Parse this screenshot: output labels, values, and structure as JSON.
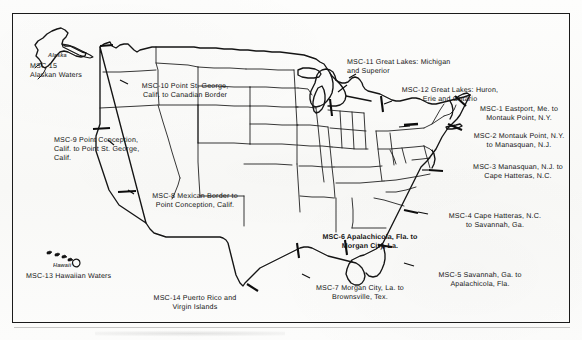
{
  "figure": {
    "type": "map",
    "frame": {
      "border_color": "#1b1b1b"
    },
    "background_color": "#fbfbfa",
    "line_color": "#141414"
  },
  "insets": [
    {
      "name": "alaska",
      "label": "Alaska"
    },
    {
      "name": "hawaii",
      "label": "Hawaii"
    }
  ],
  "zones": [
    {
      "id": "MSC-1",
      "name": "msc-1-eastport-montauk",
      "text": "MSC-1 Eastport, Me. to\nMontauk Point, N.Y.",
      "bold": false,
      "align": "center"
    },
    {
      "id": "MSC-2",
      "name": "msc-2-montauk-manasquan",
      "text": "MSC-2 Montauk Point, N.Y.\nto Manasquan, N.J.",
      "bold": false,
      "align": "center"
    },
    {
      "id": "MSC-3",
      "name": "msc-3-manasquan-hatteras",
      "text": "MSC-3 Manasquan, N.J. to\nCape Hatteras, N.C.",
      "bold": false,
      "align": "center"
    },
    {
      "id": "MSC-4",
      "name": "msc-4-hatteras-savannah",
      "text": "MSC-4 Cape Hatteras, N.C.\nto Savannah, Ga.",
      "bold": false,
      "align": "center"
    },
    {
      "id": "MSC-5",
      "name": "msc-5-savannah-apalachicola",
      "text": "MSC-5 Savannah, Ga. to\nApalachicola, Fla.",
      "bold": false,
      "align": "center"
    },
    {
      "id": "MSC-6",
      "name": "msc-6-apalachicola-morgan-city",
      "text": "MSC-6 Apalachicola, Fla. to\nMorgan City, La.",
      "bold": true,
      "align": "center"
    },
    {
      "id": "MSC-7",
      "name": "msc-7-morgan-city-brownsville",
      "text": "MSC-7 Morgan City, La. to\nBrownsville, Tex.",
      "bold": false,
      "align": "center"
    },
    {
      "id": "MSC-8",
      "name": "msc-8-mexican-border-point-conception",
      "text": "MSC-8 Mexican Border to\nPoint Conception, Calif.",
      "bold": false,
      "align": "center"
    },
    {
      "id": "MSC-9",
      "name": "msc-9-point-conception-point-st-george",
      "text": "MSC-9 Point Conception,\nCalif. to Point St. George,\nCalif.",
      "bold": false,
      "align": "left"
    },
    {
      "id": "MSC-10",
      "name": "msc-10-point-st-george-canadian-border",
      "text": "MSC-10 Point St. George,\nCalif. to Canadian Border",
      "bold": false,
      "align": "center"
    },
    {
      "id": "MSC-11",
      "name": "msc-11-great-lakes-michigan-superior",
      "text": "MSC-11 Great Lakes: Michigan\nand Superior",
      "bold": false,
      "align": "left"
    },
    {
      "id": "MSC-12",
      "name": "msc-12-great-lakes-huron-erie-ontario",
      "text": "MSC-12 Great Lakes: Huron,\nErie and Ontario",
      "bold": false,
      "align": "center"
    },
    {
      "id": "MSC-13",
      "name": "msc-13-hawaiian-waters",
      "text": "MSC-13 Hawaiian Waters",
      "bold": false,
      "align": "left"
    },
    {
      "id": "MSC-14",
      "name": "msc-14-puerto-rico-virgin-islands",
      "text": "MSC-14 Puerto Rico and\nVirgin Islands",
      "bold": false,
      "align": "center"
    },
    {
      "id": "MSC-15",
      "name": "msc-15-alaskan-waters",
      "text": "MSC-15\nAlaskan Waters",
      "bold": false,
      "align": "left"
    }
  ]
}
